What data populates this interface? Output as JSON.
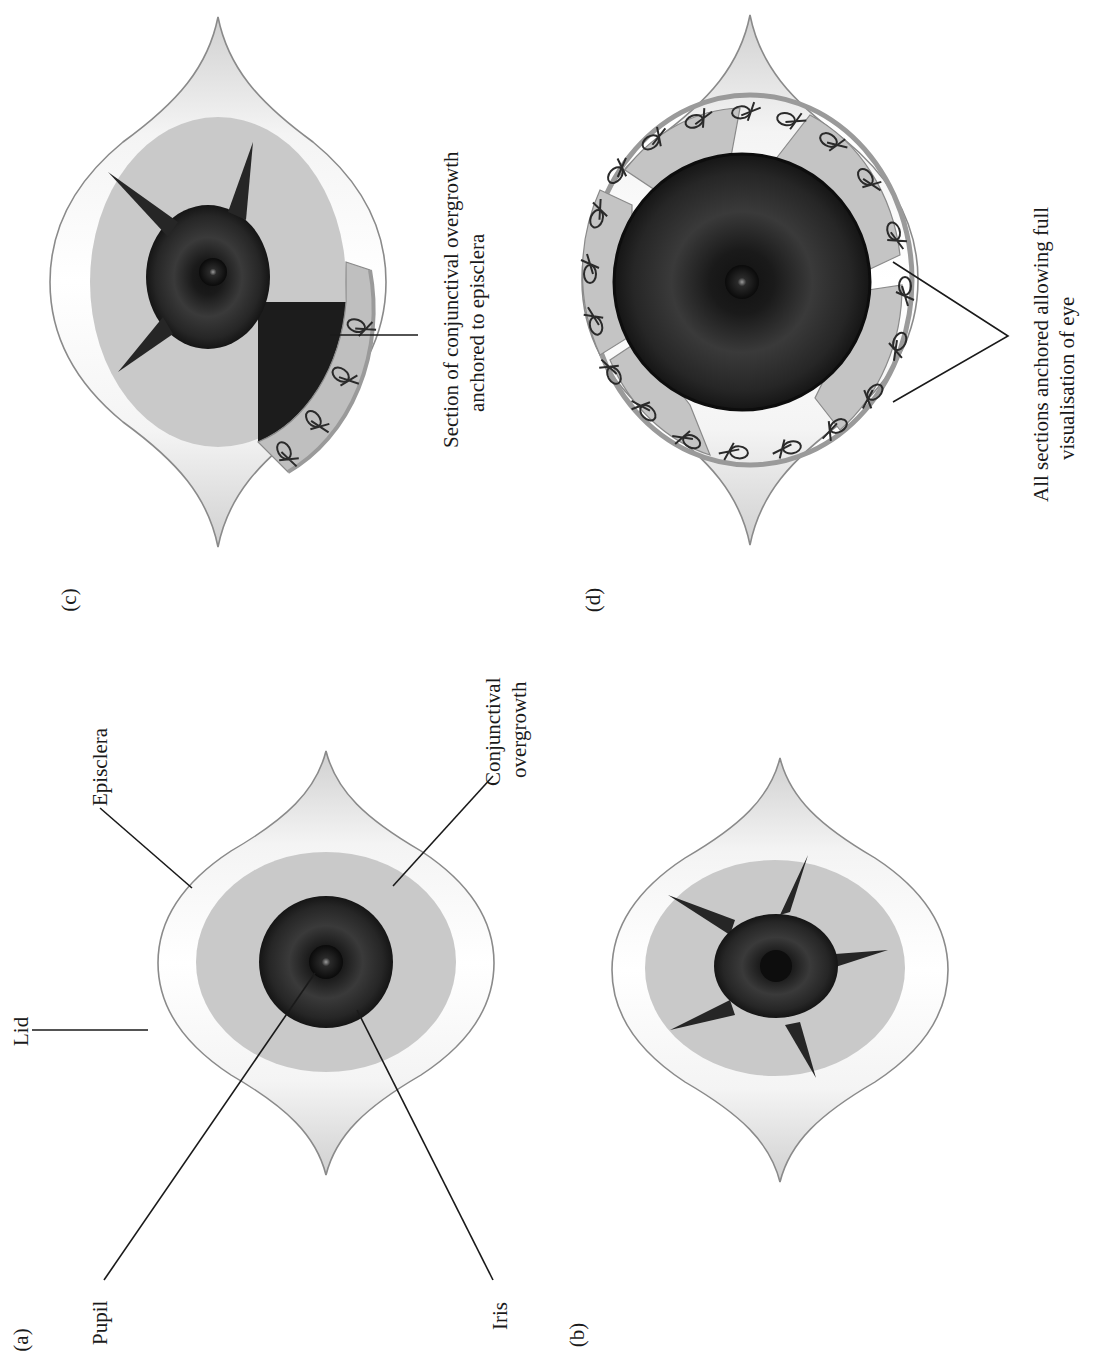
{
  "figure": {
    "colors": {
      "background": "#ffffff",
      "lid_fill": "#ffffff",
      "lid_shade": "#d4d4d4",
      "lid_outline": "#8a8a8a",
      "conjunctival_overgrowth": "#c9c9c9",
      "iris_dark": "#1c1c1c",
      "iris_mid": "#3a3a3a",
      "pupil": "#0d0d0d",
      "leader_line": "#1a1a1a",
      "suture": "#2a2a2a"
    },
    "panels": [
      {
        "id": "a",
        "label": "(a)",
        "position": "bottom-left",
        "description": "Eye with conjunctival overgrowth covering cornea",
        "annotations": {
          "lid": "Lid",
          "episclera": "Episclera",
          "pupil": "Pupil",
          "iris": "Iris",
          "conjunctival_line1": "Conjunctival",
          "conjunctival_line2": "overgrowth"
        }
      },
      {
        "id": "b",
        "label": "(b)",
        "position": "bottom-right",
        "description": "Radial incisions made through the conjunctival overgrowth",
        "incision_count": 5
      },
      {
        "id": "c",
        "label": "(c)",
        "position": "top-left",
        "description": "One section retracted and sutured",
        "annotations": {
          "section_line1": "Section of conjunctival overgrowth",
          "section_line2": "anchored to episclera"
        },
        "suture_count": 4
      },
      {
        "id": "d",
        "label": "(d)",
        "position": "top-right",
        "description": "All sections retracted and sutured",
        "annotations": {
          "all_line1": "All sections anchored allowing full",
          "all_line2": "visualisation of eye"
        },
        "suture_count": 20
      }
    ]
  }
}
